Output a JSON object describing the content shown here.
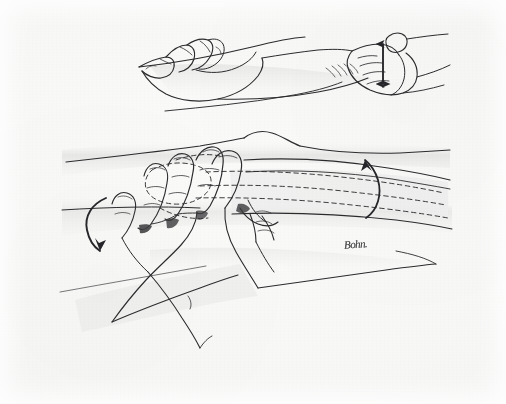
{
  "figure": {
    "title": "Hand placement for knee examination maneuver",
    "medium": "pen-and-ink line drawing on paper",
    "background_color": "#f7f7f6",
    "ink_color": "#2b2b2d",
    "shading_color": "#c9c9c8",
    "width": 506,
    "height": 404
  },
  "signature": {
    "text": "Bohn.",
    "x": 344,
    "y": 238
  },
  "panels": [
    {
      "id": "upper-inset",
      "label": "upper inset view",
      "description": "Two hands positioned on a flexed limb seen from the side; the left hand rests with fingers draped over the limb and the right hand grips the distal segment.",
      "bounds": {
        "x": 130,
        "y": 25,
        "width": 330,
        "height": 95
      }
    },
    {
      "id": "lower-main",
      "label": "lower main view",
      "description": "Close-up of both hands grasping the limb at the joint line; the underlying bone is indicated with dashed outlines.",
      "bounds": {
        "x": 60,
        "y": 125,
        "width": 400,
        "height": 215
      }
    }
  ],
  "annotations": {
    "arrows": [
      {
        "name": "vertical-double-arrow",
        "type": "double-headed-straight",
        "direction": "up-down",
        "panel": "upper-inset",
        "x": 383,
        "y": 58,
        "length": 40,
        "meaning": "anterior-posterior translation at the joint"
      },
      {
        "name": "left-curved-arrow",
        "type": "curved",
        "direction": "down",
        "panel": "lower-main",
        "x": 92,
        "y": 200,
        "meaning": "downward rotation applied by the thumb"
      },
      {
        "name": "right-curved-arrow",
        "type": "curved",
        "direction": "up",
        "panel": "lower-main",
        "x": 372,
        "y": 160,
        "meaning": "upward rotation of the distal segment"
      }
    ],
    "dashed_outlines": [
      {
        "name": "bone-outline-dashed",
        "panel": "lower-main",
        "description": "Dashed contour of the long bone shaft and condyle beneath the skin"
      },
      {
        "name": "hand-outline-dashed",
        "panel": "lower-main",
        "description": "Dashed contour of the palm obscured behind the limb"
      }
    ]
  }
}
